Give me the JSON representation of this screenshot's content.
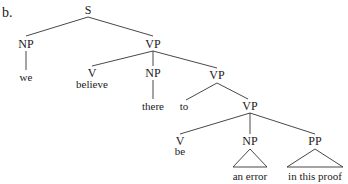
{
  "example_label": "b.",
  "nodes": {
    "s": "S",
    "np_subj": "NP",
    "we": "we",
    "vp1": "VP",
    "v1": "V",
    "believe": "believe",
    "np_obj": "NP",
    "there": "there",
    "vp2": "VP",
    "to": "to",
    "vp3": "VP",
    "v2": "V",
    "be": "be",
    "np_pred": "NP",
    "an_error": "an error",
    "pp": "PP",
    "in_this_proof": "in this proof"
  },
  "colors": {
    "line": "#333333",
    "text": "#1a1a1a"
  }
}
